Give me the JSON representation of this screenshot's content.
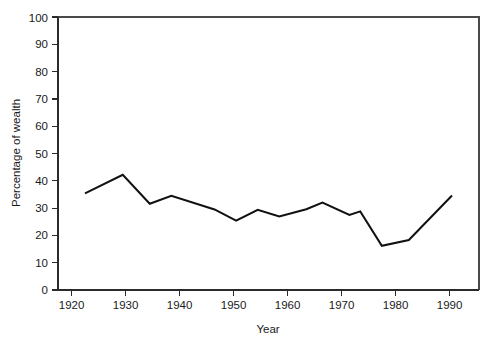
{
  "chart_data": {
    "type": "line",
    "title": "",
    "xlabel": "Year",
    "ylabel": "Percentage of wealth",
    "xlim": [
      1916,
      1994
    ],
    "ylim": [
      0,
      100
    ],
    "grid": false,
    "legend": "none",
    "xticks": [
      1920,
      1930,
      1940,
      1950,
      1960,
      1970,
      1980,
      1990
    ],
    "xtick_labels": [
      "1920",
      "1930",
      "1940",
      "1950",
      "1960",
      "1970",
      "1980",
      "1990"
    ],
    "yticks": [
      0,
      10,
      20,
      30,
      40,
      50,
      60,
      70,
      80,
      90,
      100
    ],
    "ytick_labels": [
      "0",
      "10",
      "20",
      "30",
      "40",
      "50",
      "60",
      "70",
      "80",
      "90",
      "100"
    ],
    "series": [
      {
        "name": "Percentage of wealth",
        "color": "#111111",
        "x": [
          1921,
          1928,
          1933,
          1937,
          1945,
          1949,
          1953,
          1957,
          1962,
          1965,
          1970,
          1972,
          1976,
          1981,
          1989
        ],
        "values": [
          35.4,
          42.2,
          31.6,
          34.5,
          29.5,
          25.4,
          29.4,
          26.9,
          29.6,
          32.0,
          27.5,
          28.8,
          16.2,
          18.3,
          34.6
        ]
      }
    ]
  },
  "axes": {
    "y_axis_title": "Percentage of wealth",
    "x_axis_title": "Year"
  }
}
